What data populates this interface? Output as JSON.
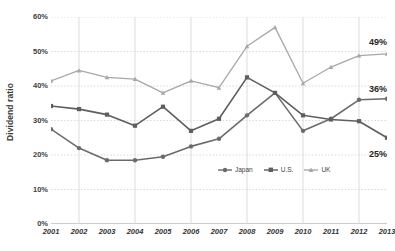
{
  "chart_data": {
    "type": "line",
    "title": "",
    "xlabel": "",
    "ylabel": "Dividend ratio",
    "categories": [
      "2001",
      "2002",
      "2003",
      "2004",
      "2005",
      "2006",
      "2007",
      "2008",
      "2009",
      "2010",
      "2011",
      "2012",
      "2013"
    ],
    "ylim": [
      0,
      60
    ],
    "xlim": [
      "2001",
      "2013"
    ],
    "ytick_labels": [
      "60%",
      "50%",
      "40%",
      "30%",
      "20%",
      "10%",
      "0%"
    ],
    "ytick_values": [
      60,
      50,
      40,
      30,
      20,
      10,
      0
    ],
    "grid": true,
    "grid_style": "dotted-horizontal-and-solid-vertical",
    "legend_position": "inside-lower-right",
    "series": [
      {
        "name": "Japan",
        "color": "#6b6b6b",
        "marker": "circle",
        "values": [
          27.5,
          22.0,
          18.5,
          18.5,
          19.5,
          22.5,
          24.7,
          31.5,
          38.0,
          27.0,
          30.5,
          36.0,
          36.3
        ],
        "end_label": "36%"
      },
      {
        "name": "U.S.",
        "color": "#5e5e5e",
        "marker": "square",
        "values": [
          34.2,
          33.3,
          31.7,
          28.5,
          34.0,
          27.0,
          30.5,
          42.5,
          38.0,
          31.5,
          30.3,
          29.8,
          25.0
        ],
        "end_label": "25%"
      },
      {
        "name": "UK",
        "color": "#a8a8a8",
        "marker": "triangle",
        "values": [
          41.5,
          44.5,
          42.5,
          42.0,
          38.0,
          41.5,
          39.5,
          51.5,
          57.0,
          40.8,
          45.5,
          48.8,
          49.3
        ],
        "end_label": "49%"
      }
    ],
    "annotations": [
      {
        "text": "49%",
        "series": "UK",
        "value": 49
      },
      {
        "text": "36%",
        "series": "Japan",
        "value": 36
      },
      {
        "text": "25%",
        "series": "U.S.",
        "value": 25
      }
    ],
    "colors": {
      "japan": "#6b6b6b",
      "us": "#5e5e5e",
      "uk": "#a8a8a8",
      "grid": "#cfcfcf",
      "axis": "#9a9a9a",
      "text": "#333333"
    }
  },
  "legend": {
    "items": [
      {
        "label": "Japan"
      },
      {
        "label": "U.S."
      },
      {
        "label": "UK"
      }
    ]
  },
  "axes": {
    "y_title": "Dividend ratio"
  }
}
